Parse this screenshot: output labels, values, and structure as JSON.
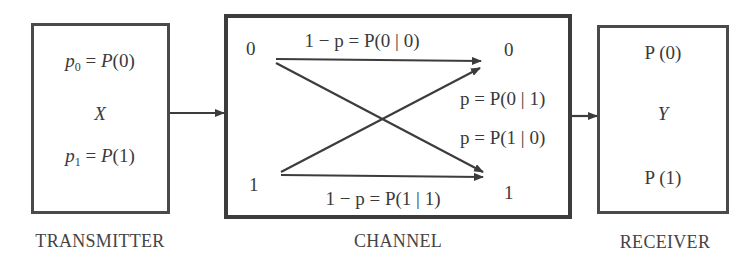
{
  "transmitter": {
    "caption": "TRANSMITTER",
    "line1": {
      "var": "p",
      "sub": "0",
      "rhs": "= P(0)"
    },
    "symbol": "X",
    "line2": {
      "var": "p",
      "sub": "1",
      "rhs": "= P(1)"
    }
  },
  "channel": {
    "caption": "CHANNEL",
    "input_0": "0",
    "input_1": "1",
    "output_0": "0",
    "output_1": "1",
    "label_00": "1 − p = P(0 | 0)",
    "label_01": "p = P(0 | 1)",
    "label_10": "p = P(1 | 0)",
    "label_11": "1 − p = P(1 | 1)"
  },
  "receiver": {
    "caption": "RECEIVER",
    "line1": "P (0)",
    "symbol": "Y",
    "line2": "P (1)"
  },
  "colors": {
    "stroke": "#3c3c3c",
    "text": "#3a3a3a",
    "background": "#ffffff"
  }
}
